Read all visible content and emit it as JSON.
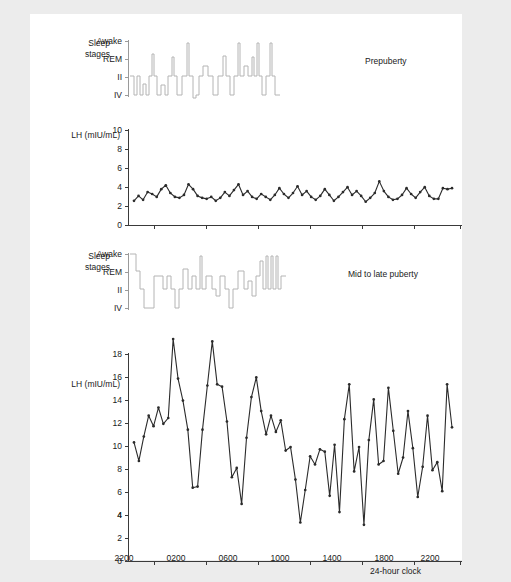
{
  "figure": {
    "background_color": "#ececec",
    "card_color": "#ffffff",
    "trace_color": "#2b2b2b",
    "hypnogram_color": "#b4b4b4",
    "xaxis_caption": "24-hour clock"
  },
  "labels": {
    "sleep_stages_line1": "Sleep",
    "sleep_stages_line2": "stages",
    "lh_axis_title": "LH (mIU/mL)",
    "sleep_stage_ticks": [
      "Awake",
      "REM",
      "II",
      "IV"
    ]
  },
  "panels": [
    {
      "id": "prepuberty",
      "tag": "Prepuberty",
      "lh_y_ticks": [
        0,
        2,
        4,
        6,
        8,
        10
      ],
      "lh_ylim": [
        0,
        10
      ]
    },
    {
      "id": "mid-late-puberty",
      "tag": "Mid to late puberty",
      "lh_y_ticks": [
        0,
        2,
        4,
        6,
        8,
        10,
        12,
        14,
        16,
        18
      ],
      "lh_ylim": [
        0,
        18
      ]
    }
  ],
  "x_ticks": [
    "2200",
    "0200",
    "0600",
    "1000",
    "1400",
    "1800",
    "2200"
  ],
  "chart_data": [
    {
      "type": "line",
      "id": "prepuberty-lh",
      "title": "Prepuberty",
      "xlabel": "24-hour clock",
      "ylabel": "LH (mIU/mL)",
      "ylim": [
        0,
        10
      ],
      "xlim": [
        2200,
        2200
      ],
      "x_tick_labels": [
        "2200",
        "0200",
        "0600",
        "1000",
        "1400",
        "1800",
        "2200"
      ],
      "grid": false,
      "legend": "none",
      "values": [
        2.6,
        3.1,
        2.7,
        3.5,
        3.3,
        3.0,
        3.8,
        4.2,
        3.4,
        3.0,
        2.9,
        3.2,
        4.3,
        3.8,
        3.1,
        2.9,
        2.8,
        3.0,
        2.6,
        2.9,
        3.5,
        3.1,
        3.7,
        4.3,
        3.2,
        3.6,
        3.0,
        2.8,
        3.3,
        3.0,
        2.7,
        3.2,
        3.9,
        3.3,
        2.9,
        3.4,
        4.1,
        3.2,
        3.6,
        3.0,
        2.7,
        3.1,
        3.8,
        3.2,
        2.6,
        3.0,
        3.5,
        4.0,
        3.2,
        3.6,
        3.1,
        2.5,
        2.9,
        3.4,
        4.6,
        3.6,
        3.0,
        2.7,
        2.8,
        3.2,
        3.9,
        3.3,
        2.9,
        3.5,
        4.0,
        3.1,
        2.8,
        2.8,
        3.9,
        3.8,
        3.9
      ]
    },
    {
      "type": "line",
      "id": "mid-late-puberty-lh",
      "title": "Mid to late puberty",
      "xlabel": "24-hour clock",
      "ylabel": "LH (mIU/mL)",
      "ylim": [
        0,
        18
      ],
      "xlim": [
        2200,
        2200
      ],
      "x_tick_labels": [
        "2200",
        "0200",
        "0600",
        "1000",
        "1400",
        "1800",
        "2200"
      ],
      "grid": false,
      "legend": "none",
      "values": [
        10.3,
        8.7,
        10.8,
        12.6,
        11.7,
        13.3,
        11.9,
        12.4,
        19.2,
        15.8,
        13.9,
        11.4,
        6.4,
        6.5,
        11.4,
        15.2,
        19.0,
        15.3,
        15.1,
        12.1,
        7.3,
        8.1,
        5.0,
        10.7,
        14.2,
        15.9,
        13.0,
        11.0,
        12.6,
        11.2,
        12.2,
        9.6,
        9.9,
        7.1,
        3.4,
        6.2,
        9.1,
        8.4,
        9.7,
        9.5,
        5.7,
        10.1,
        4.3,
        12.3,
        15.3,
        7.8,
        9.9,
        3.2,
        10.5,
        14.0,
        8.4,
        8.7,
        15.0,
        11.3,
        7.6,
        9.0,
        13.0,
        9.8,
        5.6,
        8.2,
        12.6,
        7.9,
        8.6,
        6.1,
        15.3,
        11.6
      ]
    }
  ],
  "hypnograms": [
    {
      "id": "prepuberty-hypnogram",
      "stage_levels": [
        "Awake",
        "REM",
        "II",
        "IV"
      ],
      "steps": [
        2,
        3,
        3,
        2,
        3,
        1,
        3,
        3,
        2,
        3,
        2,
        3,
        3,
        0,
        3,
        2,
        2,
        3,
        2,
        1,
        1,
        2,
        2,
        3,
        3,
        2,
        1,
        2,
        3,
        3,
        2,
        1,
        1,
        0,
        1,
        2,
        2,
        1,
        0,
        1,
        1,
        2,
        2,
        1,
        1,
        2
      ]
    },
    {
      "id": "mid-late-puberty-hypnogram",
      "stage_levels": [
        "Awake",
        "REM",
        "II",
        "IV"
      ],
      "steps": [
        0,
        1,
        2,
        3,
        3,
        1,
        2,
        2,
        1,
        2,
        3,
        2,
        1,
        0,
        1,
        2,
        2,
        1,
        2,
        2,
        3,
        2,
        1,
        2,
        3,
        2,
        1,
        1,
        2,
        1,
        0,
        1,
        0,
        1,
        0,
        1,
        1,
        2
      ]
    }
  ]
}
